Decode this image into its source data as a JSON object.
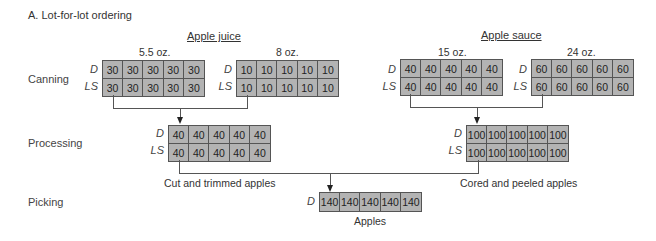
{
  "title": "A. Lot-for-lot ordering",
  "stages": {
    "canning": "Canning",
    "processing": "Processing",
    "picking": "Picking"
  },
  "row_labels": {
    "demand": "D",
    "lot_size": "LS"
  },
  "groups": {
    "apple_juice": "Apple juice",
    "apple_sauce": "Apple sauce"
  },
  "canning": {
    "juice_5_5": {
      "size": "5.5 oz.",
      "D": [
        "30",
        "30",
        "30",
        "30",
        "30"
      ],
      "LS": [
        "30",
        "30",
        "30",
        "30",
        "30"
      ]
    },
    "juice_8": {
      "size": "8 oz.",
      "D": [
        "10",
        "10",
        "10",
        "10",
        "10"
      ],
      "LS": [
        "10",
        "10",
        "10",
        "10",
        "10"
      ]
    },
    "sauce_15": {
      "size": "15 oz.",
      "D": [
        "40",
        "40",
        "40",
        "40",
        "40"
      ],
      "LS": [
        "40",
        "40",
        "40",
        "40",
        "40"
      ]
    },
    "sauce_24": {
      "size": "24 oz.",
      "D": [
        "60",
        "60",
        "60",
        "60",
        "60"
      ],
      "LS": [
        "60",
        "60",
        "60",
        "60",
        "60"
      ]
    }
  },
  "processing": {
    "cut_trimmed": {
      "caption": "Cut and trimmed apples",
      "D": [
        "40",
        "40",
        "40",
        "40",
        "40"
      ],
      "LS": [
        "40",
        "40",
        "40",
        "40",
        "40"
      ]
    },
    "cored_peeled": {
      "caption": "Cored and peeled apples",
      "D": [
        "100",
        "100",
        "100",
        "100",
        "100"
      ],
      "LS": [
        "100",
        "100",
        "100",
        "100",
        "100"
      ]
    }
  },
  "picking": {
    "apples": {
      "caption": "Apples",
      "D": [
        "140",
        "140",
        "140",
        "140",
        "140"
      ]
    }
  },
  "colors": {
    "cell_fill": "#b3b3b3",
    "border": "#555555",
    "text": "#333333"
  }
}
